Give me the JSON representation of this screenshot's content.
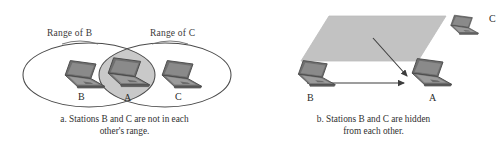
{
  "figure": {
    "background_color": "#ffffff",
    "line_color": "#4a4a4a",
    "overlap_fill": "#c9c9c9",
    "wall_fill": "#c2c2c2",
    "laptop_color": "#6e6e6e"
  },
  "panel_a": {
    "labels": {
      "range_b": "Range of B",
      "range_c": "Range of C"
    },
    "stations": [
      {
        "id": "B",
        "label": "B"
      },
      {
        "id": "A",
        "label": "A"
      },
      {
        "id": "C",
        "label": "C"
      }
    ],
    "caption": {
      "line1": "a. Stations B and C are not in each",
      "line2": "other's range."
    }
  },
  "panel_b": {
    "stations": [
      {
        "id": "C",
        "label": "C"
      },
      {
        "id": "B",
        "label": "B"
      },
      {
        "id": "A",
        "label": "A"
      }
    ],
    "obstacle": {
      "name": "wall",
      "label": ""
    },
    "arrows": [
      {
        "from": "B",
        "to": "A"
      },
      {
        "from": "C",
        "to": "A"
      }
    ],
    "caption": {
      "line1": "b. Stations B and C are hidden",
      "line2": "from each other."
    }
  }
}
